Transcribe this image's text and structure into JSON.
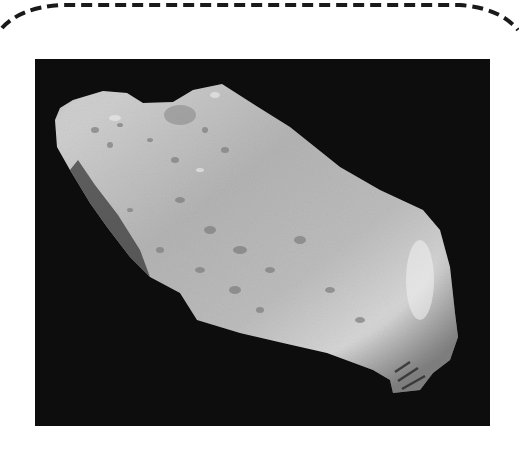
{
  "figure": {
    "subject": "asteroid",
    "alt_text": "Grayscale photograph of an elongated, cratered asteroid against black space",
    "colors": {
      "page_background": "#ffffff",
      "dashed_border": "#1a1a1a",
      "space_background": "#0d0d0d",
      "asteroid_light": "#d8d8d8",
      "asteroid_mid": "#a9a9a9",
      "asteroid_shadow": "#3a3a3a"
    }
  }
}
